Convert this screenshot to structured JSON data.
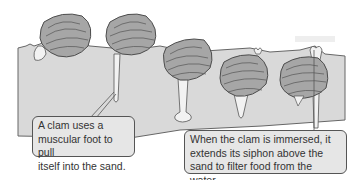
{
  "diagram": {
    "type": "illustration",
    "colors": {
      "background": "#ffffff",
      "sand": "#d9d9d9",
      "sand_outline": "#666666",
      "shell": "#a6a6a6",
      "shell_outline": "#4d4d4d",
      "foot": "#f2f2f2",
      "callout_bg": "#e6e6e6",
      "callout_border": "#555555",
      "text": "#333333"
    },
    "clams": [
      {
        "index": 1,
        "state": "on surface, foot extending",
        "shell": "sand surface"
      },
      {
        "index": 2,
        "state": "foot extended straight down"
      },
      {
        "index": 3,
        "state": "partially buried, long foot with anchor bulb"
      },
      {
        "index": 4,
        "state": "mostly buried, foot tapering"
      },
      {
        "index": 5,
        "state": "buried, siphon extended above sand"
      }
    ],
    "callouts": [
      {
        "id": "foot",
        "text": "A clam uses a\nmuscular foot to pull\nitself into the sand."
      },
      {
        "id": "siphon",
        "text": "When the clam is immersed, it\nextends its siphon above the\nsand to filter food from the water."
      }
    ]
  }
}
